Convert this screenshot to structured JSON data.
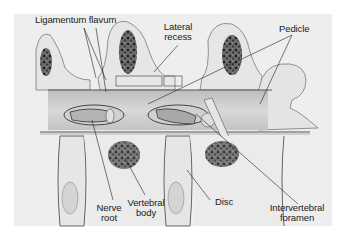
{
  "figure": {
    "type": "anatomical-illustration",
    "colors": {
      "background": "#ffffff",
      "panel": "#eeeeee",
      "bone_outline": "#7a7a7a",
      "bone_fill": "#e6e6e6",
      "marrow": "#3a3a3a",
      "leader_lines": "#222222",
      "text": "#1a1a1a"
    }
  },
  "labels": {
    "ligamentum_flavum": "Ligamentum flavum",
    "lateral_recess_line1": "Lateral",
    "lateral_recess_line2": "recess",
    "pedicle": "Pedicle",
    "nerve_root_line1": "Nerve",
    "nerve_root_line2": "root",
    "vertebral_body_line1": "Vertebral",
    "vertebral_body_line2": "body",
    "disc": "Disc",
    "intervertebral_foramen_line1": "Intervertebral",
    "intervertebral_foramen_line2": "foramen"
  }
}
